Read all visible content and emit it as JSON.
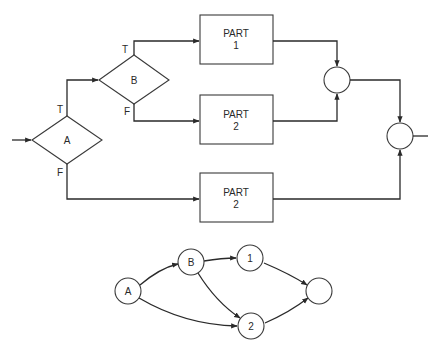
{
  "flowchart": {
    "decisions": [
      {
        "id": "A",
        "label": "A",
        "true_label": "T",
        "false_label": "F"
      },
      {
        "id": "B",
        "label": "B",
        "true_label": "T",
        "false_label": "F"
      }
    ],
    "processes": [
      {
        "id": "part1",
        "line1": "PART",
        "line2": "1"
      },
      {
        "id": "part2_mid",
        "line1": "PART",
        "line2": "2"
      },
      {
        "id": "part2_bottom",
        "line1": "PART",
        "line2": "2"
      }
    ],
    "junctions": [
      {
        "id": "join1",
        "label": ""
      },
      {
        "id": "join2",
        "label": ""
      }
    ]
  },
  "graph": {
    "nodes": [
      {
        "id": "A",
        "label": "A"
      },
      {
        "id": "B",
        "label": "B"
      },
      {
        "id": "n1",
        "label": "1"
      },
      {
        "id": "n2",
        "label": "2"
      },
      {
        "id": "end",
        "label": ""
      }
    ],
    "edges": [
      {
        "from": "A",
        "to": "B"
      },
      {
        "from": "A",
        "to": "n2"
      },
      {
        "from": "B",
        "to": "n1"
      },
      {
        "from": "B",
        "to": "n2"
      },
      {
        "from": "n1",
        "to": "end"
      },
      {
        "from": "n2",
        "to": "end"
      }
    ]
  }
}
